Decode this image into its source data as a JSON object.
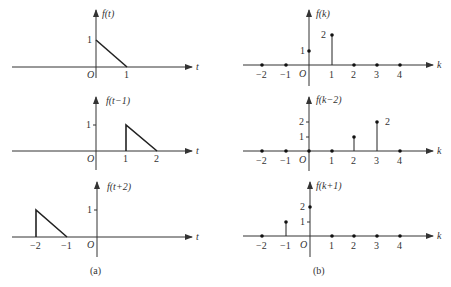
{
  "figure": {
    "panel_a": {
      "caption": "(a)",
      "axis_var": "t",
      "origin_label": "O",
      "plots": [
        {
          "title": "f(t)",
          "y_tick": "1",
          "x_ticks": [
            "1"
          ],
          "shape": "triangle from (0,1) to (1,0)"
        },
        {
          "title": "f(t−1)",
          "y_tick": "1",
          "x_ticks": [
            "1",
            "2"
          ],
          "shape": "triangle from (1,1) to (2,0)"
        },
        {
          "title": "f(t+2)",
          "y_tick": "1",
          "x_ticks": [
            "−2",
            "−1"
          ],
          "shape": "triangle from (−2,1) to (−1,0)"
        }
      ]
    },
    "panel_b": {
      "caption": "(b)",
      "axis_var": "k",
      "origin_label": "O",
      "x_ticks": [
        "−2",
        "−1",
        "1",
        "2",
        "3",
        "4"
      ],
      "plots": [
        {
          "title": "f(k)",
          "y_ticks": [
            "1",
            "2"
          ],
          "annotation": "",
          "samples": {
            "-2": 0,
            "-1": 0,
            "0": 1,
            "1": 2,
            "2": 0,
            "3": 0,
            "4": 0
          }
        },
        {
          "title": "f(k−2)",
          "y_ticks": [
            "1",
            "2"
          ],
          "annotation": "2",
          "samples": {
            "-2": 0,
            "-1": 0,
            "0": 0,
            "1": 0,
            "2": 1,
            "3": 2,
            "4": 0
          }
        },
        {
          "title": "f(k+1)",
          "y_ticks": [
            "1",
            "2"
          ],
          "annotation": "",
          "samples": {
            "-2": 0,
            "-1": 1,
            "0": 2,
            "1": 0,
            "2": 0,
            "3": 0,
            "4": 0
          }
        }
      ]
    }
  }
}
